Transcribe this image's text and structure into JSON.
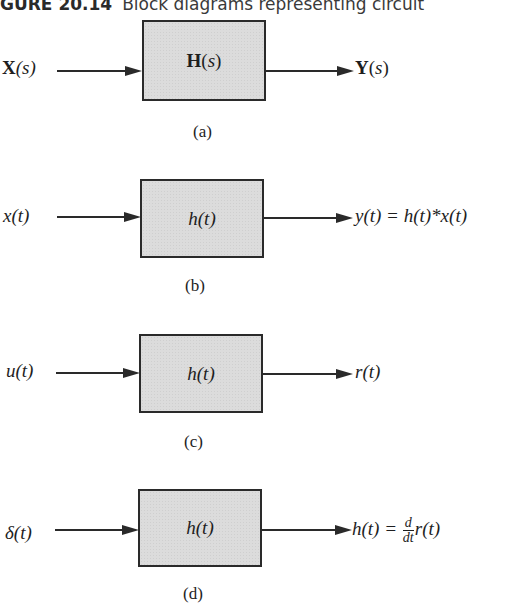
{
  "caption": {
    "figure_number": "GURE 20.14",
    "text": "Block diagrams representing circuit"
  },
  "panels": [
    {
      "id": "a",
      "input": "X(s)",
      "block": "H(s)",
      "output": "Y(s)",
      "sublabel": "(a)"
    },
    {
      "id": "b",
      "input": "x(t)",
      "block": "h(t)",
      "output": "y(t) = h(t)*x(t)",
      "sublabel": "(b)"
    },
    {
      "id": "c",
      "input": "u(t)",
      "block": "h(t)",
      "output": "r(t)",
      "sublabel": "(c)"
    },
    {
      "id": "d",
      "input": "δ(t)",
      "block": "h(t)",
      "output_lhs": "h(t) =",
      "output_frac_num": "d",
      "output_frac_den": "dt",
      "output_rhs": "r(t)",
      "sublabel": "(d)"
    }
  ]
}
